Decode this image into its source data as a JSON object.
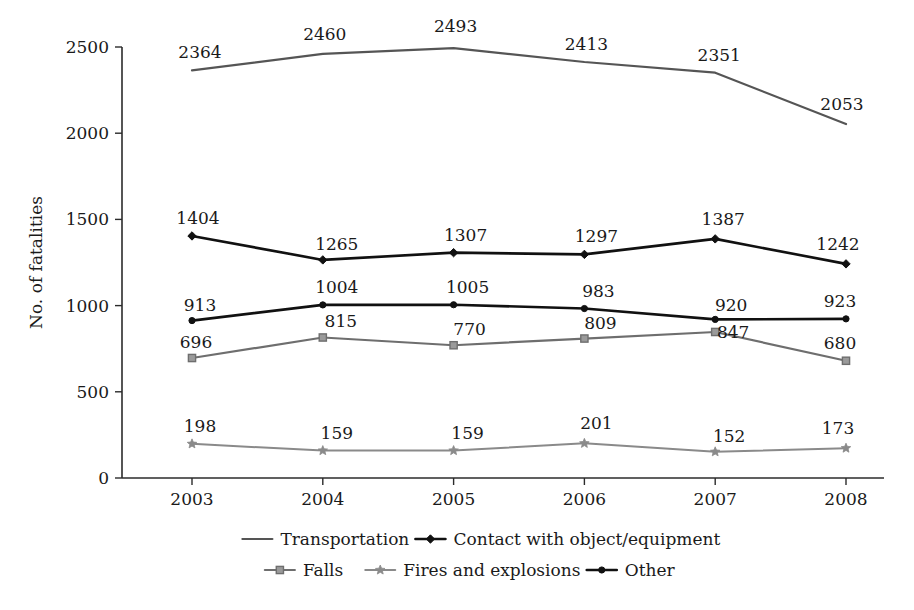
{
  "chart_data": {
    "type": "line",
    "title": "",
    "xlabel": "",
    "ylabel": "No. of fatalities",
    "categories": [
      "2003",
      "2004",
      "2005",
      "2006",
      "2007",
      "2008"
    ],
    "x": [
      2003,
      2004,
      2005,
      2006,
      2007,
      2008
    ],
    "ylim": [
      0,
      2500
    ],
    "y_ticks": [
      0,
      500,
      1000,
      1500,
      2000,
      2500
    ],
    "y_tick_labels": [
      "0",
      "500",
      "1000",
      "1500",
      "2000",
      "2500"
    ],
    "grid": false,
    "legend_position": "bottom",
    "series": [
      {
        "name": "Transportation",
        "values": [
          2364,
          2460,
          2493,
          2413,
          2351,
          2053
        ],
        "color": "#555555",
        "marker": "none",
        "line_width": 2.2,
        "label_offsets": [
          {
            "dx": 8,
            "dy": -12
          },
          {
            "dx": 2,
            "dy": -14
          },
          {
            "dx": 2,
            "dy": -16
          },
          {
            "dx": 2,
            "dy": -12
          },
          {
            "dx": 4,
            "dy": -12
          },
          {
            "dx": -4,
            "dy": -14
          }
        ]
      },
      {
        "name": "Contact with object/equipment",
        "values": [
          1404,
          1265,
          1307,
          1297,
          1387,
          1242
        ],
        "color": "#111111",
        "marker": "diamond",
        "line_width": 2.6,
        "label_offsets": [
          {
            "dx": 6,
            "dy": -12
          },
          {
            "dx": 14,
            "dy": -10
          },
          {
            "dx": 12,
            "dy": -12
          },
          {
            "dx": 12,
            "dy": -12
          },
          {
            "dx": 8,
            "dy": -14
          },
          {
            "dx": -8,
            "dy": -14
          }
        ]
      },
      {
        "name": "Other",
        "values": [
          913,
          1004,
          1005,
          983,
          920,
          923
        ],
        "color": "#111111",
        "marker": "dot",
        "line_width": 2.6,
        "label_offsets": [
          {
            "dx": 8,
            "dy": -10
          },
          {
            "dx": 14,
            "dy": -12
          },
          {
            "dx": 14,
            "dy": -12
          },
          {
            "dx": 14,
            "dy": -12
          },
          {
            "dx": 16,
            "dy": -8
          },
          {
            "dx": -6,
            "dy": -12
          }
        ]
      },
      {
        "name": "Falls",
        "values": [
          696,
          815,
          770,
          809,
          847,
          680
        ],
        "color": "#6e6e6e",
        "marker": "square",
        "line_width": 2.2,
        "label_offsets": [
          {
            "dx": 4,
            "dy": -10
          },
          {
            "dx": 18,
            "dy": -10
          },
          {
            "dx": 16,
            "dy": -10
          },
          {
            "dx": 16,
            "dy": -10
          },
          {
            "dx": 18,
            "dy": 6
          },
          {
            "dx": -6,
            "dy": -12
          }
        ]
      },
      {
        "name": "Fires and explosions",
        "values": [
          198,
          159,
          159,
          201,
          152,
          173
        ],
        "color": "#8a8a8a",
        "marker": "star",
        "line_width": 2.0,
        "label_offsets": [
          {
            "dx": 8,
            "dy": -12
          },
          {
            "dx": 14,
            "dy": -12
          },
          {
            "dx": 14,
            "dy": -12
          },
          {
            "dx": 12,
            "dy": -14
          },
          {
            "dx": 14,
            "dy": -10
          },
          {
            "dx": -8,
            "dy": -14
          }
        ]
      }
    ]
  },
  "legend": {
    "rows": [
      [
        {
          "label": "Transportation",
          "series": 0
        },
        {
          "label": "Contact with object/equipment",
          "series": 1
        }
      ],
      [
        {
          "label": "Falls",
          "series": 3
        },
        {
          "label": "Fires and explosions",
          "series": 4
        },
        {
          "label": "Other",
          "series": 2
        }
      ]
    ]
  },
  "plot_geometry": {
    "left": 122,
    "right": 884,
    "top": 47,
    "bottom": 478,
    "x_first": 192,
    "x_last": 846
  }
}
